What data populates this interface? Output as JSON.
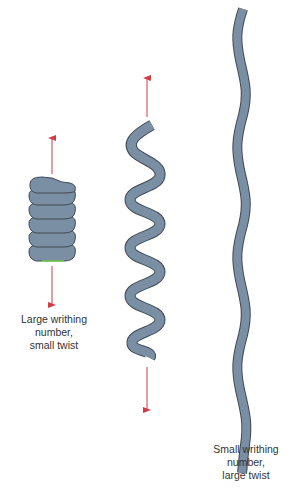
{
  "colors": {
    "tube_fill": "#7a8fa3",
    "tube_stroke": "#3f4a55",
    "arrow": "#d23b46",
    "text": "#333333",
    "highlight": "#7ad24e"
  },
  "figures": [
    {
      "id": "coiled",
      "description": "tightly coiled supercoil with arrows above and below",
      "coil_turns": 6,
      "label_lines": [
        "Large writhing",
        "number,",
        "small twist"
      ]
    },
    {
      "id": "helix",
      "description": "extended helical supercoil with arrows above and below",
      "helix_turns": 6
    },
    {
      "id": "straight",
      "description": "nearly straight wavy strand",
      "label_lines": [
        "Small writhing",
        "number,",
        "large twist"
      ]
    }
  ]
}
